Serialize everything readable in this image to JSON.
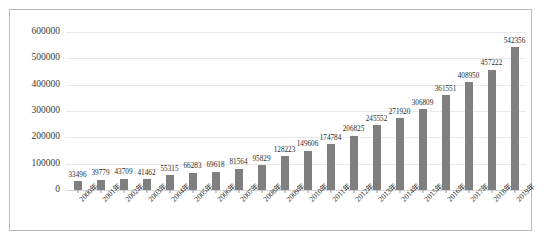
{
  "chart_data": {
    "type": "bar",
    "title": "",
    "xlabel": "",
    "ylabel": "",
    "ylim": [
      0,
      600000
    ],
    "yticks": [
      "0",
      "100000",
      "200000",
      "300000",
      "400000",
      "500000",
      "600000"
    ],
    "ytick_values": [
      0,
      100000,
      200000,
      300000,
      400000,
      500000,
      600000
    ],
    "grid": true,
    "legend": "none",
    "bar_color": "#7f7f7f",
    "categories": [
      "2000年",
      "2001年",
      "2002年",
      "2003年",
      "2004年",
      "2005年",
      "2006年",
      "2007年",
      "2008年",
      "2009年",
      "2010年",
      "2011年",
      "2012年",
      "2013年",
      "2014年",
      "2015年",
      "2016年",
      "2017年",
      "2018年",
      "2019年"
    ],
    "values": [
      33496,
      39779,
      43709,
      41462,
      55315,
      66283,
      69618,
      81564,
      95829,
      128223,
      149606,
      174784,
      206825,
      245552,
      271920,
      306809,
      361551,
      408950,
      457222,
      542356
    ],
    "data_labels": [
      "33496",
      "39779",
      "43709",
      "41462",
      "55315",
      "66283",
      "69618",
      "81564",
      "95829",
      "128223",
      "149606",
      "174784",
      "206825",
      "245552",
      "271920",
      "306809",
      "361551",
      "408950",
      "457222",
      "542356"
    ]
  }
}
